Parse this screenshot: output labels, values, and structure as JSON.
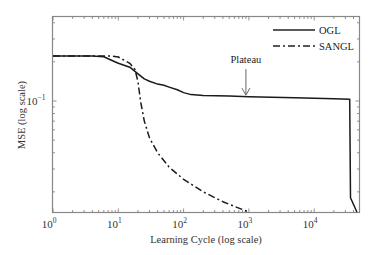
{
  "chart_data": {
    "type": "line",
    "title": "",
    "xlabel": "Learning Cycle (log scale)",
    "ylabel": "MSE (log scale)",
    "xscale": "log",
    "yscale": "log",
    "xlim": [
      1,
      50000
    ],
    "ylim": [
      0.014,
      0.45
    ],
    "grid": false,
    "legend_position": "upper right",
    "x_ticks": [
      {
        "value": 1,
        "label_base": "10",
        "label_exp": "0"
      },
      {
        "value": 10,
        "label_base": "10",
        "label_exp": "1"
      },
      {
        "value": 100,
        "label_base": "10",
        "label_exp": "2"
      },
      {
        "value": 1000,
        "label_base": "10",
        "label_exp": "3"
      },
      {
        "value": 10000,
        "label_base": "10",
        "label_exp": "4"
      }
    ],
    "y_ticks": [
      {
        "value": 0.1,
        "label_base": "10",
        "label_exp": "−1"
      }
    ],
    "series": [
      {
        "name": "OGL",
        "style": "solid",
        "points": [
          [
            1,
            0.222
          ],
          [
            2,
            0.222
          ],
          [
            4,
            0.222
          ],
          [
            6,
            0.219
          ],
          [
            8,
            0.205
          ],
          [
            10,
            0.195
          ],
          [
            15,
            0.182
          ],
          [
            20,
            0.162
          ],
          [
            25,
            0.148
          ],
          [
            30,
            0.142
          ],
          [
            40,
            0.135
          ],
          [
            50,
            0.132
          ],
          [
            60,
            0.128
          ],
          [
            80,
            0.122
          ],
          [
            100,
            0.116
          ],
          [
            130,
            0.112
          ],
          [
            200,
            0.11
          ],
          [
            500,
            0.109
          ],
          [
            1000,
            0.108
          ],
          [
            5000,
            0.106
          ],
          [
            20000,
            0.104
          ],
          [
            35000,
            0.103
          ],
          [
            36000,
            0.018
          ],
          [
            45000,
            0.014
          ]
        ]
      },
      {
        "name": "SANGL",
        "style": "dash-dot",
        "points": [
          [
            1,
            0.222
          ],
          [
            5,
            0.222
          ],
          [
            8,
            0.222
          ],
          [
            10,
            0.218
          ],
          [
            15,
            0.195
          ],
          [
            18,
            0.175
          ],
          [
            20,
            0.14
          ],
          [
            22,
            0.098
          ],
          [
            25,
            0.07
          ],
          [
            30,
            0.052
          ],
          [
            40,
            0.04
          ],
          [
            60,
            0.031
          ],
          [
            100,
            0.025
          ],
          [
            200,
            0.02
          ],
          [
            400,
            0.0168
          ],
          [
            700,
            0.015
          ],
          [
            1000,
            0.014
          ]
        ]
      }
    ],
    "annotations": [
      {
        "text": "Plateau",
        "x": 900,
        "y": 0.109,
        "arrow": "down"
      }
    ]
  }
}
